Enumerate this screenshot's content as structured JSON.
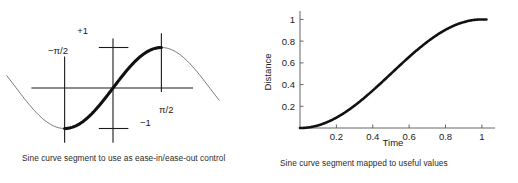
{
  "page": {
    "background_color": "#ffffff",
    "ink_color": "#1a1a1a"
  },
  "figures": [
    {
      "id": "sine-segment-diagram",
      "caption": "Sine curve segment to use as ease-in/ease-out control",
      "labels": {
        "plus_one": "+1",
        "minus_one": "−1",
        "neg_half_pi": "−π/2",
        "half_pi": "π/2"
      },
      "chart_data": {
        "type": "line",
        "title": "",
        "xlabel": "",
        "ylabel": "",
        "xlim": [
          -3.45,
          3.45
        ],
        "ylim": [
          -1.25,
          1.25
        ],
        "grid": false,
        "legend": null,
        "annotations": [
          "+1",
          "−1",
          "−π/2",
          "π/2"
        ],
        "series": [
          {
            "name": "sin(x) full (thin)",
            "style": "thin",
            "x": [
              -3.45,
              -3.2,
              -3.0,
              -2.75,
              -2.5,
              -2.25,
              -2.0,
              -1.75,
              -1.5708,
              -1.25,
              -1.0,
              -0.75,
              -0.5,
              -0.25,
              0,
              0.25,
              0.5,
              0.75,
              1.0,
              1.25,
              1.5708,
              1.75,
              2.0,
              2.25,
              2.5,
              2.75,
              3.0,
              3.2,
              3.45
            ],
            "y": [
              0.304,
              0.058,
              -0.141,
              -0.382,
              -0.599,
              -0.778,
              -0.909,
              -0.984,
              -1.0,
              -0.949,
              -0.841,
              -0.682,
              -0.479,
              -0.247,
              0,
              0.247,
              0.479,
              0.682,
              0.841,
              0.949,
              1.0,
              0.984,
              0.909,
              0.778,
              0.599,
              0.382,
              0.141,
              -0.058,
              -0.304
            ]
          },
          {
            "name": "sin(x) segment [-pi/2, pi/2] (thick)",
            "style": "thick",
            "x": [
              -1.5708,
              -1.35,
              -1.15,
              -0.95,
              -0.75,
              -0.55,
              -0.35,
              -0.15,
              0,
              0.15,
              0.35,
              0.55,
              0.75,
              0.95,
              1.15,
              1.35,
              1.5708
            ],
            "y": [
              -1.0,
              -0.9757,
              -0.9128,
              -0.8134,
              -0.6816,
              -0.5227,
              -0.3429,
              -0.1494,
              0,
              0.1494,
              0.3429,
              0.5227,
              0.6816,
              0.8134,
              0.9128,
              0.9757,
              1.0
            ]
          }
        ],
        "markers": [
          {
            "name": "vertical-line-neg-half-pi",
            "x": -1.5708,
            "y_from": -1.35,
            "y_to": 0.78
          },
          {
            "name": "vertical-line-origin",
            "x": 0.0,
            "y_from": -1.35,
            "y_to": 1.22
          },
          {
            "name": "vertical-line-half-pi",
            "x": 1.5708,
            "y_from": -0.1,
            "y_to": 1.35
          },
          {
            "name": "horizontal-axis",
            "y": 0.0,
            "x_from": -2.65,
            "x_to": 2.6
          },
          {
            "name": "tick-plus-one",
            "y": 1.0,
            "x_from": -0.46,
            "x_to": 0.5
          },
          {
            "name": "tick-minus-one",
            "y": -1.0,
            "x_from": -0.46,
            "x_to": 0.5
          }
        ]
      }
    },
    {
      "id": "sine-mapped-plot",
      "caption": "Sine curve segment mapped to useful values",
      "axis": {
        "xlabel": "Time",
        "ylabel": "Distance",
        "xticks": [
          "0.2",
          "0.4",
          "0.6",
          "0.8",
          "1"
        ],
        "yticks": [
          "0.2",
          "0.4",
          "0.6",
          "0.8",
          "1"
        ]
      },
      "chart_data": {
        "type": "line",
        "title": "",
        "xlabel": "Time",
        "ylabel": "Distance",
        "xlim": [
          0,
          1.05
        ],
        "ylim": [
          0,
          1.05
        ],
        "xticks": [
          0.2,
          0.4,
          0.6,
          0.8,
          1
        ],
        "xticklabels": [
          "0.2",
          "0.4",
          "0.6",
          "0.8",
          "1"
        ],
        "yticks": [
          0.2,
          0.4,
          0.6,
          0.8,
          1
        ],
        "yticklabels": [
          "0.2",
          "0.4",
          "0.6",
          "0.8",
          "1"
        ],
        "grid": false,
        "legend": null,
        "series": [
          {
            "name": "ease-in/ease-out = (sin(pi*t - pi/2) + 1)/2",
            "x": [
              0,
              0.05,
              0.1,
              0.15,
              0.2,
              0.25,
              0.3,
              0.35,
              0.4,
              0.45,
              0.5,
              0.55,
              0.6,
              0.65,
              0.7,
              0.75,
              0.8,
              0.85,
              0.9,
              0.95,
              1.0,
              1.025
            ],
            "y": [
              0.0,
              0.0062,
              0.0245,
              0.0545,
              0.0955,
              0.1464,
              0.2061,
              0.273,
              0.3455,
              0.4218,
              0.5,
              0.5782,
              0.6545,
              0.727,
              0.7939,
              0.8536,
              0.9045,
              0.9455,
              0.9755,
              0.9938,
              1.0,
              1.0
            ]
          }
        ]
      }
    }
  ]
}
